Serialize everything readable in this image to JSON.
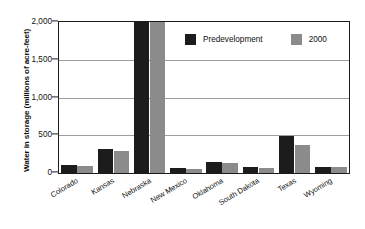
{
  "chart_data": {
    "type": "bar",
    "title": "",
    "xlabel": "",
    "ylabel": "Water in storage (millions of acre-feet)",
    "ylim": [
      0,
      2000
    ],
    "yticks": [
      "0",
      "500",
      "1,000",
      "1,500",
      "2,000"
    ],
    "ytick_values": [
      0,
      500,
      1000,
      1500,
      2000
    ],
    "grid": "horizontal",
    "legend_position": "top-center",
    "categories": [
      "Colorado",
      "Kansas",
      "Nebraska",
      "New Mexico",
      "Oklahoma",
      "South Dakota",
      "Texas",
      "Wyoming"
    ],
    "series": [
      {
        "name": "Predevelopment",
        "color": "#1c1c1c",
        "values": [
          100,
          320,
          2120,
          60,
          140,
          75,
          490,
          85
        ]
      },
      {
        "name": "2000",
        "color": "#8b8b8b",
        "values": [
          95,
          290,
          2060,
          55,
          130,
          70,
          370,
          80
        ]
      }
    ]
  },
  "legend": {
    "items": [
      {
        "label": "Predevelopment"
      },
      {
        "label": "2000"
      }
    ]
  }
}
